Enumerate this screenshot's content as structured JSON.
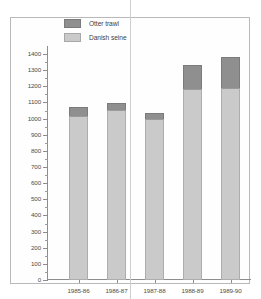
{
  "chart_data": {
    "type": "bar",
    "subtype": "stacked-vertical",
    "title": "",
    "subtitle": "",
    "xlabel": "",
    "ylabel": "",
    "categories": [
      "1985-86",
      "1986-87",
      "1987-88",
      "1988-89",
      "1989-90"
    ],
    "series": [
      {
        "name": "Danish seine",
        "color": "#cacaca",
        "values": [
          1015,
          1055,
          995,
          1185,
          1190
        ]
      },
      {
        "name": "Otter trawl",
        "color": "#8f8f8f",
        "values": [
          60,
          40,
          40,
          150,
          195
        ]
      }
    ],
    "totals": [
      1075,
      1095,
      1035,
      1335,
      1385
    ],
    "ylim": [
      0,
      1450
    ],
    "ytick_step": 100,
    "yticks": [
      0,
      100,
      200,
      300,
      400,
      500,
      600,
      700,
      800,
      900,
      1000,
      1100,
      1200,
      1300,
      1400
    ],
    "ytick_labels": [
      "0",
      "100",
      "200",
      "300",
      "400",
      "500",
      "600",
      "700",
      "800",
      "900",
      "1000",
      "1100",
      "1200",
      "1300",
      "1400"
    ],
    "minor_ticks": true,
    "grid": false,
    "legend_position": "top-left-inside",
    "legend_order": [
      "Otter trawl",
      "Danish seine"
    ]
  },
  "legend": {
    "rows": [
      {
        "label": "Otter trawl",
        "swatch": "dark-gray-swatch"
      },
      {
        "label": "Danish seine",
        "swatch": "light-gray-swatch"
      }
    ]
  }
}
